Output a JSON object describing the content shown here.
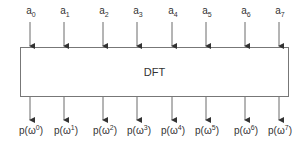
{
  "diagram": {
    "block": {
      "label": "DFT"
    },
    "inputs": [
      {
        "base": "a",
        "sub": "0"
      },
      {
        "base": "a",
        "sub": "1"
      },
      {
        "base": "a",
        "sub": "2"
      },
      {
        "base": "a",
        "sub": "3"
      },
      {
        "base": "a",
        "sub": "4"
      },
      {
        "base": "a",
        "sub": "5"
      },
      {
        "base": "a",
        "sub": "6"
      },
      {
        "base": "a",
        "sub": "7"
      }
    ],
    "outputs": [
      {
        "pre": "p(ω",
        "sup": "0",
        "post": ")"
      },
      {
        "pre": "p(ω",
        "sup": "1",
        "post": ")"
      },
      {
        "pre": "p(ω",
        "sup": "2",
        "post": ")"
      },
      {
        "pre": "p(ω",
        "sup": "3",
        "post": ")"
      },
      {
        "pre": "p(ω",
        "sup": "4",
        "post": ")"
      },
      {
        "pre": "p(ω",
        "sup": "5",
        "post": ")"
      },
      {
        "pre": "p(ω",
        "sup": "6",
        "post": ")"
      },
      {
        "pre": "p(ω",
        "sup": "7",
        "post": ")"
      }
    ],
    "colors": {
      "stroke": "#555555",
      "text": "#333333"
    }
  }
}
